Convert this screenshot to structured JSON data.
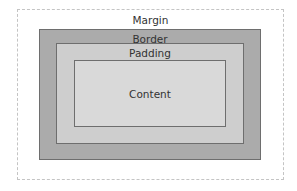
{
  "diagram": {
    "layers": {
      "margin": {
        "label": "Margin",
        "color": "#ffffff"
      },
      "border": {
        "label": "Border",
        "color": "#ababab"
      },
      "padding": {
        "label": "Padding",
        "color": "#cecece"
      },
      "content": {
        "label": "Content",
        "color": "#d9d9d9"
      }
    }
  }
}
